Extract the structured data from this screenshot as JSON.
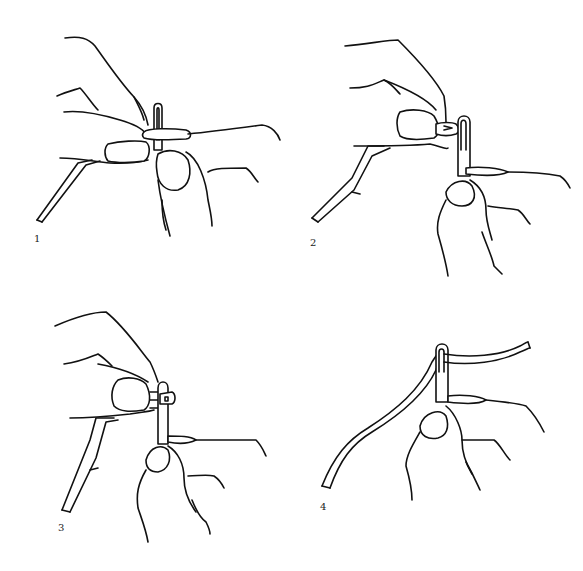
{
  "figure": {
    "line_color": "#111111",
    "background": "#ffffff",
    "panels": [
      {
        "step": "1",
        "label_pos": {
          "x": 34,
          "y": 234
        }
      },
      {
        "step": "2",
        "label_pos": {
          "x": 310,
          "y": 238
        }
      },
      {
        "step": "3",
        "label_pos": {
          "x": 58,
          "y": 523
        }
      },
      {
        "step": "4",
        "label_pos": {
          "x": 320,
          "y": 502
        }
      }
    ]
  }
}
